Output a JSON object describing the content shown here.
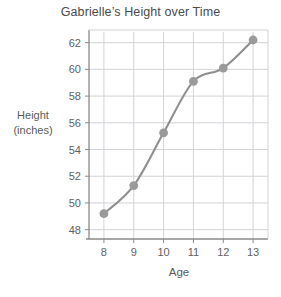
{
  "chart_data": {
    "type": "line",
    "title": "Gabrielle’s Height over Time",
    "xlabel": "Age",
    "ylabel": "Height (inches)",
    "ylabel_lines": [
      "Height",
      "(inches)"
    ],
    "x": [
      8,
      9,
      10,
      11,
      12,
      13
    ],
    "values": [
      49.2,
      51.3,
      55.25,
      59.1,
      60.1,
      62.2
    ],
    "series": [
      {
        "name": "Height",
        "values": [
          49.2,
          51.3,
          55.25,
          59.1,
          60.1,
          62.2
        ]
      }
    ],
    "categories": [
      "8",
      "9",
      "10",
      "11",
      "12",
      "13"
    ],
    "xticklabels": [
      "8",
      "9",
      "10",
      "11",
      "12",
      "13"
    ],
    "yticklabels": [
      "48",
      "50",
      "52",
      "54",
      "56",
      "58",
      "60",
      "62"
    ],
    "yticks": [
      48,
      50,
      52,
      54,
      56,
      58,
      60,
      62
    ],
    "xlim": [
      7.5,
      13.5
    ],
    "ylim": [
      47.3,
      62.8
    ],
    "grid": true,
    "legend": false,
    "legend_position": "none",
    "marker": "circle",
    "colors": {
      "line": "#8f8f8f",
      "marker": "#9a9a9a",
      "grid": "#d3d3d9",
      "frame": "#8a8a8a",
      "text": "#5a5a5a",
      "background": "#ffffff"
    }
  }
}
